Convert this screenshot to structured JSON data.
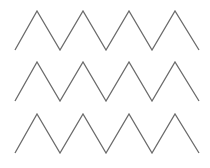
{
  "diagram": {
    "type": "zigzag-pattern",
    "stroke_color": "#6b6b6b",
    "stroke_width": 1.3,
    "background": "#ffffff",
    "rows": [
      {
        "points": "15,50 37,11 60,50 83,11 106,50 129,11 152,50 175,11 199,50"
      },
      {
        "points": "15,101 37,62 60,101 83,62 106,101 129,62 152,101 175,62 199,101"
      },
      {
        "points": "15,153 37,114 60,153 83,114 106,153 129,114 152,153 175,114 199,153"
      }
    ]
  }
}
